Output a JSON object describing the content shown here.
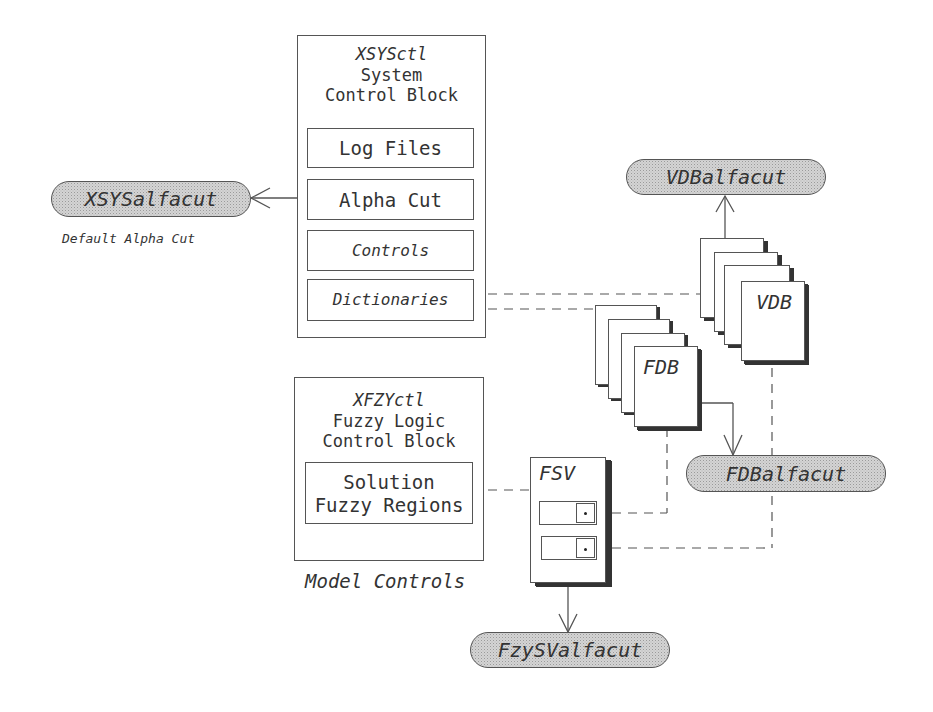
{
  "system_block": {
    "name": "XSYSctl",
    "line1": "System",
    "line2": "Control Block",
    "fields": [
      {
        "label": "Log Files"
      },
      {
        "label": "Alpha Cut"
      },
      {
        "label": "Controls"
      },
      {
        "label": "Dictionaries"
      }
    ]
  },
  "fuzzy_block": {
    "name": "XFZYctl",
    "line1": "Fuzzy Logic",
    "line2": "Control Block",
    "field_line1": "Solution",
    "field_line2": "Fuzzy Regions"
  },
  "model_controls_caption": "Model Controls",
  "alpha_nodes": {
    "xsys": "XSYSalfacut",
    "xsys_caption": "Default Alpha Cut",
    "vdb": "VDBalfacut",
    "fdb": "FDBalfacut",
    "fzysv": "FzySValfacut"
  },
  "stacks": {
    "vdb_label": "VDB",
    "fdb_label": "FDB",
    "fsv_label": "FSV"
  },
  "colors": {
    "line": "#555555",
    "pill_fill": "#d4d4d4",
    "shadow": "#333333"
  }
}
